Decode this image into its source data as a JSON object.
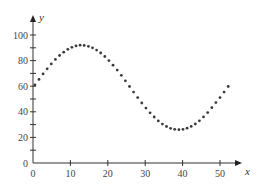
{
  "chart_data": {
    "type": "scatter",
    "title": "",
    "xlabel": "x",
    "ylabel": "y",
    "xlim": [
      0,
      55
    ],
    "ylim": [
      0,
      110
    ],
    "grid": false,
    "legend": null,
    "x_ticks": [
      0,
      10,
      20,
      30,
      40,
      50
    ],
    "x_tick_labels": [
      "0",
      "10",
      "20",
      "30",
      "40",
      "50"
    ],
    "y_ticks": [
      0,
      10,
      20,
      30,
      40,
      50,
      60,
      70,
      80,
      90,
      100
    ],
    "y_tick_labels": [
      "0",
      "",
      "20",
      "",
      "40",
      "",
      "60",
      "",
      "80",
      "",
      "100"
    ],
    "series": [
      {
        "name": "data",
        "marker": "dot",
        "color": "#3a3a3a",
        "x": [
          0.5,
          1.6,
          2.7,
          3.8,
          4.9,
          6.0,
          7.1,
          8.2,
          9.3,
          10.4,
          11.5,
          12.6,
          13.7,
          14.8,
          15.9,
          17.0,
          18.1,
          19.2,
          20.3,
          21.4,
          22.5,
          23.6,
          24.7,
          25.8,
          26.9,
          28.0,
          29.1,
          30.2,
          31.3,
          32.4,
          33.5,
          34.6,
          35.7,
          36.8,
          37.9,
          39.0,
          40.1,
          41.2,
          42.3,
          43.4,
          44.5,
          45.6,
          46.7,
          47.8,
          48.9,
          50.0,
          51.1,
          52.2
        ],
        "y": [
          61.0,
          65.3,
          69.6,
          73.6,
          77.4,
          80.9,
          84.0,
          86.6,
          88.8,
          90.4,
          91.5,
          92.0,
          91.9,
          91.2,
          90.0,
          88.2,
          85.9,
          83.2,
          80.0,
          76.4,
          72.6,
          68.5,
          64.2,
          59.8,
          55.4,
          51.1,
          46.9,
          42.9,
          39.2,
          35.9,
          32.9,
          30.4,
          28.5,
          27.1,
          26.3,
          26.0,
          26.3,
          27.2,
          28.6,
          30.5,
          33.0,
          36.0,
          39.4,
          43.2,
          47.2,
          51.1,
          55.4,
          59.8
        ]
      }
    ]
  }
}
